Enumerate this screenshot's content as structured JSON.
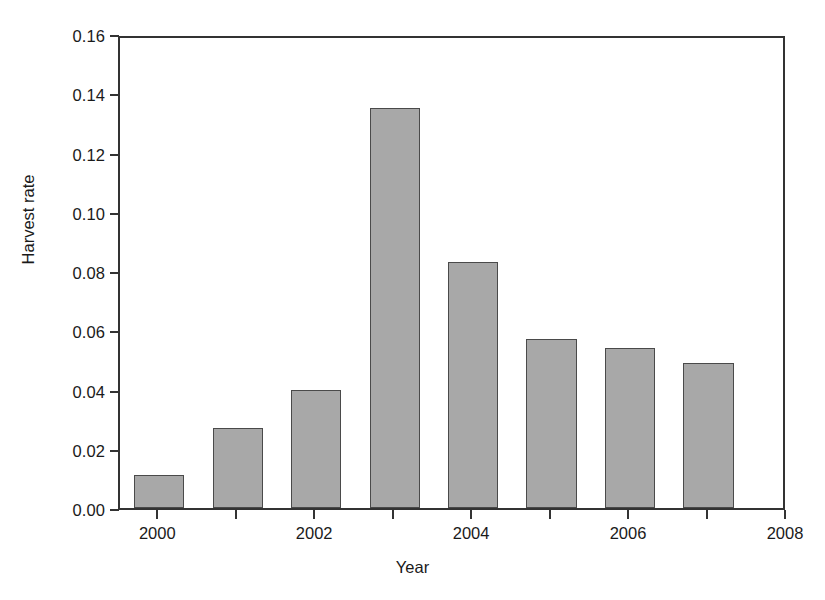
{
  "chart_data": {
    "type": "bar",
    "title": "",
    "xlabel": "Year",
    "ylabel": "Harvest rate",
    "categories": [
      "2000",
      "2001",
      "2002",
      "2003",
      "2004",
      "2005",
      "2006",
      "2007"
    ],
    "values": [
      0.011,
      0.027,
      0.04,
      0.135,
      0.083,
      0.057,
      0.054,
      0.049
    ],
    "xlim": [
      1999.5,
      2008
    ],
    "ylim": [
      0.0,
      0.16
    ],
    "xticks": [
      "2000",
      "2002",
      "2004",
      "2006",
      "2008"
    ],
    "xtick_values": [
      2000,
      2002,
      2004,
      2006,
      2008
    ],
    "yticks": [
      "0.00",
      "0.02",
      "0.04",
      "0.06",
      "0.08",
      "0.10",
      "0.12",
      "0.14",
      "0.16"
    ],
    "ytick_values": [
      0.0,
      0.02,
      0.04,
      0.06,
      0.08,
      0.1,
      0.12,
      0.14,
      0.16
    ],
    "grid": false,
    "legend": null,
    "bar_color": "#a8a8a8",
    "bar_edge_color": "#4a4a4a",
    "axis_color": "#333333",
    "annotations": [
      {
        "label": "Restrictive regulations",
        "span_start": 1999.6,
        "span_end": 2002.25,
        "style": "double-headed-arrow-with-end-caps"
      },
      {
        "label": "Moderate regulations",
        "span_start": 2002.5,
        "span_end": 2007.3,
        "style": "double-headed-arrow-with-end-caps"
      }
    ]
  },
  "axes": {
    "y_title": "Harvest rate",
    "x_title": "Year",
    "y_tick_labels": [
      "0.16",
      "0.14",
      "0.12",
      "0.10",
      "0.08",
      "0.06",
      "0.04",
      "0.02",
      "0.00"
    ],
    "x_tick_labels": [
      "2000",
      "2002",
      "2004",
      "2006",
      "2008"
    ]
  },
  "annotations": {
    "restrictive": "Restrictive regulations",
    "moderate": "Moderate regulations"
  }
}
